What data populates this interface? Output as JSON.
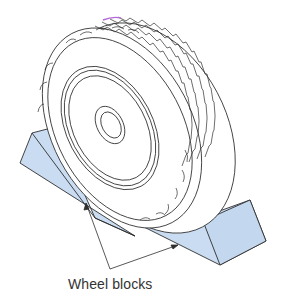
{
  "figure": {
    "label": "Wheel blocks",
    "colors": {
      "block_fill": "#c9dcf2",
      "line": "#2f2f2f",
      "label_text": "#333333",
      "tread_highlight": "#b46ad8"
    }
  }
}
